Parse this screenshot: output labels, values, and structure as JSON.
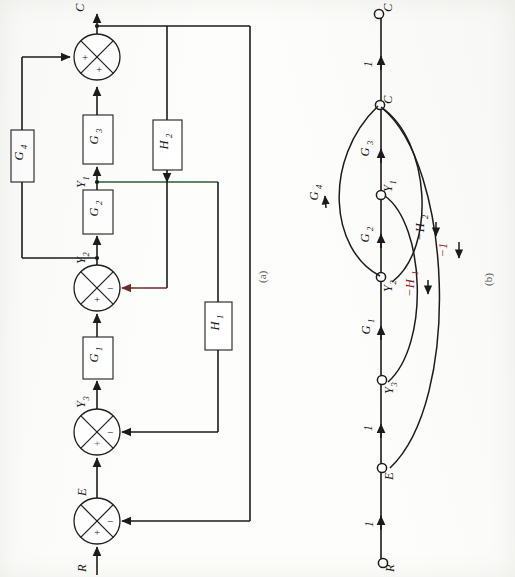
{
  "figure": {
    "panel_a_label": "(a)",
    "panel_b_label": "(b)",
    "orientation_note": "rotated"
  },
  "block_diagram": {
    "blocks": [
      {
        "name": "G4",
        "label": "G",
        "sub": "4"
      },
      {
        "name": "G3",
        "label": "G",
        "sub": "3"
      },
      {
        "name": "H2",
        "label": "H",
        "sub": "2"
      },
      {
        "name": "G2",
        "label": "G",
        "sub": "2"
      },
      {
        "name": "H1",
        "label": "H",
        "sub": "1"
      },
      {
        "name": "G1",
        "label": "G",
        "sub": "1"
      }
    ],
    "signals": [
      {
        "name": "C",
        "label": "C",
        "sub": ""
      },
      {
        "name": "Y1",
        "label": "Y",
        "sub": "1"
      },
      {
        "name": "Y2",
        "label": "Y",
        "sub": "2"
      },
      {
        "name": "Y3",
        "label": "Y",
        "sub": "3"
      },
      {
        "name": "E",
        "label": "E",
        "sub": ""
      },
      {
        "name": "R",
        "label": "R",
        "sub": ""
      }
    ],
    "summers": [
      {
        "name": "sum-top",
        "signs": [
          "+",
          "+"
        ]
      },
      {
        "name": "sum-y2",
        "signs": [
          "-",
          "+"
        ]
      },
      {
        "name": "sum-y3",
        "signs": [
          "-",
          "+"
        ]
      },
      {
        "name": "sum-e",
        "signs": [
          "-",
          "+"
        ]
      }
    ],
    "plus": "+",
    "minus": "−"
  },
  "flow_graph": {
    "nodes": [
      {
        "name": "node-C-out",
        "label": "C",
        "sub": ""
      },
      {
        "name": "node-C",
        "label": "C",
        "sub": ""
      },
      {
        "name": "node-Y1",
        "label": "Y",
        "sub": "1"
      },
      {
        "name": "node-Y2",
        "label": "Y",
        "sub": "2"
      },
      {
        "name": "node-Y3",
        "label": "Y",
        "sub": "3"
      },
      {
        "name": "node-E",
        "label": "E",
        "sub": ""
      },
      {
        "name": "node-R",
        "label": "R",
        "sub": ""
      }
    ],
    "edges": [
      {
        "name": "edge-C-to-Cout",
        "label": "1",
        "sub": "",
        "from": "C",
        "to": "C-out"
      },
      {
        "name": "edge-Y1-to-C",
        "label": "G",
        "sub": "3",
        "from": "Y1",
        "to": "C"
      },
      {
        "name": "edge-Y2-to-Y1",
        "label": "G",
        "sub": "2",
        "from": "Y2",
        "to": "Y1"
      },
      {
        "name": "edge-Y3-to-Y2",
        "label": "G",
        "sub": "1",
        "from": "Y3",
        "to": "Y2"
      },
      {
        "name": "edge-E-to-Y3",
        "label": "1",
        "sub": "",
        "from": "E",
        "to": "Y3"
      },
      {
        "name": "edge-R-to-E",
        "label": "1",
        "sub": "",
        "from": "R",
        "to": "E"
      },
      {
        "name": "edge-Y2-to-C",
        "label": "G",
        "sub": "4",
        "from": "Y2",
        "to": "C"
      },
      {
        "name": "edge-C-to-Y2",
        "label": "−H",
        "sub": "2",
        "from": "C",
        "to": "Y2"
      },
      {
        "name": "edge-Y1-to-Y3",
        "label": "−H",
        "sub": "1",
        "from": "Y1",
        "to": "Y3"
      },
      {
        "name": "edge-C-to-E",
        "label": "−1",
        "sub": "",
        "from": "C",
        "to": "E"
      }
    ]
  }
}
